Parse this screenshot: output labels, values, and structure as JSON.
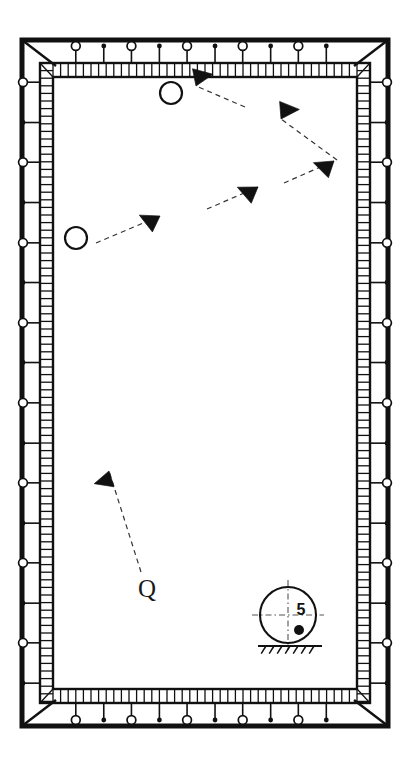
{
  "figure": {
    "kind": "engineering-plan-diagram",
    "background_color": "#ffffff",
    "line_color": "#111111",
    "accent_color": "#333333",
    "width": 410,
    "height": 766
  },
  "frame": {
    "outer": {
      "x": 22,
      "y": 40,
      "width": 366,
      "height": 686,
      "stroke_width": 5
    },
    "inner_band": {
      "x": 40,
      "y": 63,
      "width": 330,
      "height": 640,
      "stroke_width": 2.2
    },
    "cavity": {
      "x": 53,
      "y": 77,
      "width": 304,
      "height": 612
    },
    "corner_diagonal_length": 28,
    "rung_pitch": 7.6
  },
  "edge_markers": {
    "open_circle_radius": 4.4,
    "filled_dot_radius": 2.4,
    "stem_length": 17,
    "top": [
      {
        "type": "open-circle",
        "pos": 0.075
      },
      {
        "type": "filled-dot",
        "pos": 0.167
      },
      {
        "type": "open-circle",
        "pos": 0.258
      },
      {
        "type": "filled-dot",
        "pos": 0.35
      },
      {
        "type": "open-circle",
        "pos": 0.441
      },
      {
        "type": "filled-dot",
        "pos": 0.533
      },
      {
        "type": "open-circle",
        "pos": 0.624
      },
      {
        "type": "filled-dot",
        "pos": 0.716
      },
      {
        "type": "open-circle",
        "pos": 0.807
      },
      {
        "type": "filled-dot",
        "pos": 0.899
      }
    ],
    "bottom": [
      {
        "type": "open-circle",
        "pos": 0.075
      },
      {
        "type": "filled-dot",
        "pos": 0.167
      },
      {
        "type": "open-circle",
        "pos": 0.258
      },
      {
        "type": "filled-dot",
        "pos": 0.35
      },
      {
        "type": "open-circle",
        "pos": 0.441
      },
      {
        "type": "filled-dot",
        "pos": 0.533
      },
      {
        "type": "open-circle",
        "pos": 0.624
      },
      {
        "type": "filled-dot",
        "pos": 0.716
      },
      {
        "type": "open-circle",
        "pos": 0.807
      },
      {
        "type": "filled-dot",
        "pos": 0.899
      }
    ],
    "left": [
      {
        "type": "open-circle",
        "pos": 0.03
      },
      {
        "type": "filled-dot",
        "pos": 0.093
      },
      {
        "type": "open-circle",
        "pos": 0.155
      },
      {
        "type": "filled-dot",
        "pos": 0.218
      },
      {
        "type": "open-circle",
        "pos": 0.281
      },
      {
        "type": "filled-dot",
        "pos": 0.343
      },
      {
        "type": "open-circle",
        "pos": 0.406
      },
      {
        "type": "filled-dot",
        "pos": 0.468
      },
      {
        "type": "open-circle",
        "pos": 0.531
      },
      {
        "type": "filled-dot",
        "pos": 0.594
      },
      {
        "type": "open-circle",
        "pos": 0.656
      },
      {
        "type": "filled-dot",
        "pos": 0.719
      },
      {
        "type": "open-circle",
        "pos": 0.781
      },
      {
        "type": "filled-dot",
        "pos": 0.844
      },
      {
        "type": "open-circle",
        "pos": 0.906
      },
      {
        "type": "filled-dot",
        "pos": 0.969
      }
    ],
    "right": [
      {
        "type": "open-circle",
        "pos": 0.03
      },
      {
        "type": "filled-dot",
        "pos": 0.093
      },
      {
        "type": "open-circle",
        "pos": 0.155
      },
      {
        "type": "filled-dot",
        "pos": 0.218
      },
      {
        "type": "open-circle",
        "pos": 0.281
      },
      {
        "type": "filled-dot",
        "pos": 0.343
      },
      {
        "type": "open-circle",
        "pos": 0.406
      },
      {
        "type": "filled-dot",
        "pos": 0.468
      },
      {
        "type": "open-circle",
        "pos": 0.531
      },
      {
        "type": "filled-dot",
        "pos": 0.594
      },
      {
        "type": "open-circle",
        "pos": 0.656
      },
      {
        "type": "filled-dot",
        "pos": 0.719
      },
      {
        "type": "open-circle",
        "pos": 0.781
      },
      {
        "type": "filled-dot",
        "pos": 0.844
      },
      {
        "type": "open-circle",
        "pos": 0.906
      },
      {
        "type": "filled-dot",
        "pos": 0.969
      }
    ]
  },
  "arrows": [
    {
      "id": "arrow-1",
      "tip_x": 196,
      "tip_y": 86,
      "angle_deg": 118,
      "size": 17,
      "tail_x": 245,
      "tail_y": 107
    },
    {
      "id": "arrow-2",
      "tip_x": 281,
      "tip_y": 119,
      "angle_deg": 125,
      "size": 17,
      "tail_x": 337,
      "tail_y": 160
    },
    {
      "id": "arrow-3",
      "tip_x": 334,
      "tip_y": 161,
      "angle_deg": -32,
      "size": 17,
      "tail_x": 284,
      "tail_y": 183
    },
    {
      "id": "arrow-4",
      "tip_x": 258,
      "tip_y": 187,
      "angle_deg": -28,
      "size": 17,
      "tail_x": 207,
      "tail_y": 209
    },
    {
      "id": "arrow-5",
      "tip_x": 160,
      "tip_y": 216,
      "angle_deg": -25,
      "size": 17,
      "tail_x": 96,
      "tail_y": 243
    },
    {
      "id": "arrow-6",
      "tip_x": 109,
      "tip_y": 471,
      "angle_deg": -68,
      "size": 16,
      "tail_x": 141,
      "tail_y": 572
    }
  ],
  "markers": [
    {
      "id": "circle-top",
      "type": "open-circle",
      "cx": 171,
      "cy": 93,
      "r": 11
    },
    {
      "id": "circle-left",
      "type": "open-circle",
      "cx": 76,
      "cy": 238,
      "r": 11
    },
    {
      "id": "q-symbol",
      "type": "letter",
      "cx": 147,
      "cy": 591,
      "glyph": "Q",
      "font_size": 25
    }
  ],
  "detail_callout": {
    "id": "detail-5",
    "label": "5",
    "circle": {
      "cx": 288,
      "cy": 615,
      "r": 28
    },
    "label_x": 301,
    "label_y": 611,
    "label_font_size": 16,
    "center_mark_x": 299,
    "center_mark_y": 630,
    "center_mark_r": 5,
    "centerline_h": {
      "x1": 252,
      "y1": 615,
      "x2": 324,
      "y2": 615
    },
    "centerline_v": {
      "x1": 288,
      "y1": 580,
      "x2": 288,
      "y2": 650
    },
    "ground": {
      "line": {
        "x1": 258,
        "y1": 646,
        "x2": 322,
        "y2": 646
      },
      "hatch_count": 7,
      "hatch_len": 9,
      "hatch_angle_deg": 58
    }
  }
}
